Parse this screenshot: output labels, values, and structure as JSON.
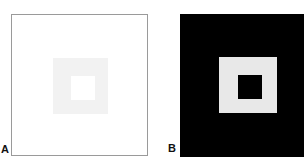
{
  "figure": {
    "type": "simultaneous-brightness-contrast",
    "background_color": "#ffffff",
    "panels": [
      {
        "id": "A",
        "label": "A",
        "frame_color": "#ffffff",
        "frame_border_color": "#9a9a9a",
        "surround_color": "#f2f2f2",
        "target_color": "#ffffff",
        "surround_description": "light gray square",
        "target_description": "white inner square"
      },
      {
        "id": "B",
        "label": "B",
        "frame_color": "#000000",
        "frame_border_color": "#000000",
        "surround_color": "#e8e8e8",
        "target_color": "#000000",
        "surround_description": "near-white square",
        "target_description": "black inner square"
      }
    ]
  }
}
